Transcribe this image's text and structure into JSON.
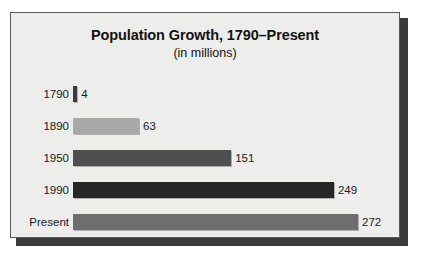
{
  "chart_data": {
    "type": "bar",
    "orientation": "horizontal",
    "title": "Population Growth, 1790–Present",
    "subtitle": "(in millions)",
    "xlabel": "",
    "ylabel": "",
    "unit": "millions",
    "grid": false,
    "legend": "none",
    "xlim": [
      0,
      272
    ],
    "categories": [
      "1790",
      "1890",
      "1950",
      "1990",
      "Present"
    ],
    "values": [
      4,
      63,
      151,
      249,
      272
    ],
    "value_labels": [
      "4",
      "63",
      "151",
      "249",
      "272"
    ],
    "bar_colors": [
      "#3b3b3b",
      "#a8a8a8",
      "#4f4f4f",
      "#262626",
      "#6e6e6e"
    ],
    "bars": [
      {
        "category": "1790",
        "value": 4,
        "label": "4",
        "color": "#3b3b3b"
      },
      {
        "category": "1890",
        "value": 63,
        "label": "63",
        "color": "#a8a8a8"
      },
      {
        "category": "1950",
        "value": 151,
        "label": "151",
        "color": "#4f4f4f"
      },
      {
        "category": "1990",
        "value": 249,
        "label": "249",
        "color": "#262626"
      },
      {
        "category": "Present",
        "value": 272,
        "label": "272",
        "color": "#6e6e6e"
      }
    ]
  },
  "panel": {
    "background_color": "#ededeb",
    "border_color": "#59595b",
    "shadow_color": "#3a3a3a"
  }
}
